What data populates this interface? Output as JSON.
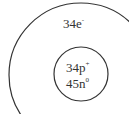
{
  "diagram": {
    "type": "atom-model",
    "electron_shell": {
      "label": "34e",
      "superscript": "-"
    },
    "nucleus": {
      "protons": {
        "label": "34p",
        "superscript": "+"
      },
      "neutrons": {
        "label": "45n",
        "superscript": "0"
      }
    },
    "colors": {
      "stroke": "#333333",
      "text": "#333333",
      "background": "#ffffff"
    }
  }
}
